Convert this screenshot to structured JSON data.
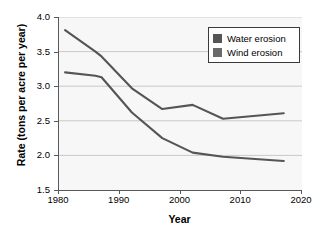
{
  "chart_data": {
    "type": "line",
    "title": "",
    "xlabel": "Year",
    "ylabel": "Rate (tons per acre per year)",
    "xlim": [
      1980,
      2020
    ],
    "ylim": [
      1.5,
      4.0
    ],
    "xticks": [
      "1980",
      "1990",
      "2000",
      "2010",
      "2020"
    ],
    "yticks": [
      "1.5",
      "2.0",
      "2.5",
      "3.0",
      "3.5",
      "4.0"
    ],
    "grid": "horizontal",
    "legend_position": "top-right",
    "series": [
      {
        "name": "Water erosion",
        "color": "#555555",
        "x": [
          1981,
          1986,
          1987,
          1992,
          1997,
          2002,
          2007,
          2017
        ],
        "values": [
          3.81,
          3.5,
          3.43,
          2.97,
          2.67,
          2.73,
          2.53,
          2.61
        ]
      },
      {
        "name": "Wind erosion",
        "color": "#555555",
        "x": [
          1981,
          1986,
          1987,
          1992,
          1997,
          2002,
          2007,
          2017
        ],
        "values": [
          3.2,
          3.15,
          3.13,
          2.62,
          2.25,
          2.04,
          1.98,
          1.92
        ]
      }
    ]
  },
  "legend": {
    "items": [
      {
        "label": "Water erosion",
        "color": "#555555"
      },
      {
        "label": "Wind erosion",
        "color": "#6a6a6a"
      }
    ]
  },
  "axes": {
    "y_labels": [
      "4.0",
      "3.5",
      "3.0",
      "2.5",
      "2.0",
      "1.5"
    ],
    "x_labels": [
      "1980",
      "1990",
      "2000",
      "2010",
      "2020"
    ],
    "x_title": "Year",
    "y_title": "Rate (tons per acre per year)"
  }
}
